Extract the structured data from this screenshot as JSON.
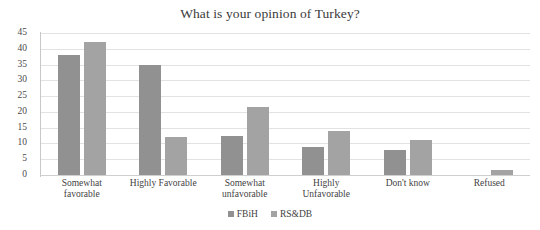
{
  "chart_data": {
    "type": "bar",
    "title": "What is your opinion of Turkey?",
    "xlabel": "",
    "ylabel": "",
    "ylim": [
      0,
      45
    ],
    "ytick_step": 5,
    "yticks": [
      45,
      40,
      35,
      30,
      25,
      20,
      15,
      10,
      5,
      0
    ],
    "grid": true,
    "legend_position": "bottom",
    "categories": [
      "Somewhat favorable",
      "Highly Favorable",
      "Somewhat unfavorable",
      "Highly Unfavorable",
      "Don't know",
      "Refused"
    ],
    "category_lines": [
      [
        "Somewhat",
        "favorable"
      ],
      [
        "Highly Favorable"
      ],
      [
        "Somewhat",
        "unfavorable"
      ],
      [
        "Highly",
        "Unfavorable"
      ],
      [
        "Don't know"
      ],
      [
        "Refused"
      ]
    ],
    "series": [
      {
        "name": "FBiH",
        "color": "#919191",
        "values": [
          38,
          35,
          12.5,
          9,
          8,
          0
        ]
      },
      {
        "name": "RS&DB",
        "color": "#a3a3a3",
        "values": [
          42,
          12,
          21.5,
          14,
          11,
          1.5
        ]
      }
    ]
  },
  "legend": {
    "items": [
      {
        "label": "FBiH",
        "color": "#919191"
      },
      {
        "label": "RS&DB",
        "color": "#a3a3a3"
      }
    ]
  },
  "colors": {
    "series_1": "#919191",
    "series_2": "#a3a3a3",
    "gridline": "#e2e2e2",
    "axis": "#c8c8c8",
    "text": "#3f3f3f",
    "background": "#ffffff"
  }
}
